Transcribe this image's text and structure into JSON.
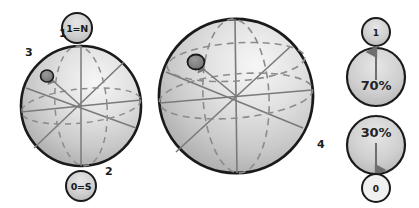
{
  "figure": {
    "background_color": "#ffffff",
    "width": 419,
    "height": 208
  },
  "palette": {
    "sphere_outline": "#1a1a1a",
    "sphere_fill_light": "#f2f2f2",
    "sphere_fill_mid": "#cfcfcf",
    "sphere_fill_dark": "#a9a9a9",
    "grid_solid": "#7a7a7a",
    "grid_dashed": "#8c8c8c",
    "state_marker_fill": "#7d7d7d",
    "state_marker_stroke": "#1a1a1a",
    "label_text": "#1b1b1b",
    "pole_badge_fill": "#c9c9c9",
    "pole_badge_stroke": "#1a1a1a",
    "prob_badge_fill": "#d4d4d4",
    "arrow_color": "#6e6e6e"
  },
  "small_sphere": {
    "name": "small-bloch-sphere",
    "center": {
      "x": 81,
      "y": 106
    },
    "radius": 60,
    "callouts": [
      {
        "id": "callout-1",
        "label": "1",
        "x": 62,
        "y": 34
      },
      {
        "id": "callout-2",
        "label": "2",
        "x": 108,
        "y": 172
      },
      {
        "id": "callout-3",
        "label": "3",
        "x": 28,
        "y": 53
      }
    ],
    "north_badge": {
      "label": "1=N",
      "cx": 77,
      "cy": 28,
      "r": 15
    },
    "south_badge": {
      "label": "0=S",
      "cx": 81,
      "cy": 186,
      "r": 15
    },
    "state_marker": {
      "cx": 47,
      "cy": 76,
      "rx": 6.5,
      "ry": 6
    }
  },
  "large_sphere": {
    "name": "large-bloch-sphere",
    "center": {
      "x": 236,
      "y": 96
    },
    "radius": 77,
    "callouts": [
      {
        "id": "callout-4",
        "label": "4",
        "x": 320,
        "y": 144
      }
    ],
    "state_marker": {
      "cx": 196,
      "cy": 62,
      "rx": 8.5,
      "ry": 7.5
    }
  },
  "probability_column": {
    "name": "probability-column",
    "top_outcome": {
      "label": "1",
      "cx": 376,
      "cy": 32,
      "r": 14
    },
    "top_probability": {
      "label": "70%",
      "cx": 376,
      "cy": 77,
      "r": 29,
      "arrow_direction": "up"
    },
    "bottom_probability": {
      "label": "30%",
      "cx": 376,
      "cy": 145,
      "r": 29,
      "arrow_direction": "down"
    },
    "bottom_outcome": {
      "label": "0",
      "cx": 376,
      "cy": 188,
      "r": 14
    }
  }
}
